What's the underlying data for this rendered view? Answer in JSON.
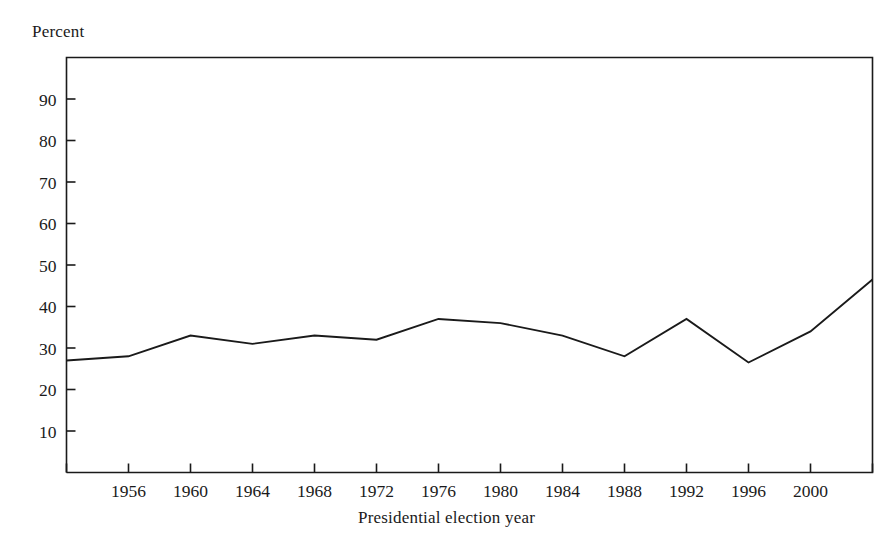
{
  "figure": {
    "y_unit_label": "Percent",
    "x_axis_title": "Presidential election year",
    "line_color": "#1a1a1a",
    "axis_color": "#1a1a1a",
    "background_color": "#ffffff"
  },
  "chart_data": {
    "type": "line",
    "title": "",
    "subtitle": "",
    "xlabel": "Presidential election year",
    "ylabel": "Percent",
    "grid": false,
    "legend": null,
    "legend_position": "none",
    "xlim": [
      1952,
      2004
    ],
    "ylim": [
      0,
      100
    ],
    "x": [
      1952,
      1956,
      1960,
      1964,
      1968,
      1972,
      1976,
      1980,
      1984,
      1988,
      1992,
      1996,
      2000,
      2004
    ],
    "xtick_labels": [
      "1956",
      "1960",
      "1964",
      "1968",
      "1972",
      "1976",
      "1980",
      "1984",
      "1988",
      "1992",
      "1996",
      "2000"
    ],
    "xtick_values": [
      1956,
      1960,
      1964,
      1968,
      1972,
      1976,
      1980,
      1984,
      1988,
      1992,
      1996,
      2000
    ],
    "ytick_labels": [
      "10",
      "20",
      "30",
      "40",
      "50",
      "60",
      "70",
      "80",
      "90"
    ],
    "ytick_values": [
      10,
      20,
      30,
      40,
      50,
      60,
      70,
      80,
      90
    ],
    "series": [
      {
        "name": "Percent",
        "values": [
          27,
          28,
          33,
          31,
          33,
          32,
          37,
          36,
          33,
          28,
          37,
          26.5,
          34,
          46.5
        ]
      }
    ]
  }
}
